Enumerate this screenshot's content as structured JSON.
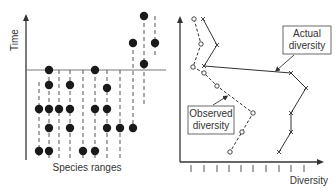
{
  "left_panel": {
    "y_axis_label": "Time",
    "x_axis_label": "Species ranges",
    "boundary_y": 70,
    "columns": [
      {
        "x": 39,
        "range": [
          82,
          158
        ],
        "dots": [
          109,
          151
        ]
      },
      {
        "x": 49,
        "range": [
          70,
          158
        ],
        "dots": [
          70,
          85,
          109,
          128,
          151
        ]
      },
      {
        "x": 59,
        "range": [
          70,
          158
        ],
        "dots": [
          109
        ]
      },
      {
        "x": 70,
        "range": [
          70,
          158
        ],
        "dots": [
          85,
          109,
          128
        ]
      },
      {
        "x": 83,
        "range": [
          70,
          158
        ],
        "dots": [
          151
        ]
      },
      {
        "x": 95,
        "range": [
          70,
          158
        ],
        "dots": [
          70,
          109,
          151
        ]
      },
      {
        "x": 107,
        "range": [
          70,
          158
        ],
        "dots": [
          88,
          109,
          128
        ]
      },
      {
        "x": 120,
        "range": [
          70,
          158
        ],
        "dots": [
          128
        ]
      },
      {
        "x": 133,
        "range": [
          43,
          128
        ],
        "dots": [
          43,
          128
        ]
      },
      {
        "x": 144,
        "range": [
          16,
          105
        ],
        "dots": [
          16,
          64
        ]
      },
      {
        "x": 155,
        "range": [
          16,
          58
        ],
        "dots": [
          43
        ]
      }
    ]
  },
  "right_panel": {
    "x_axis_label": "Diversity",
    "actual_label": [
      "Actual",
      "diversity"
    ],
    "observed_label": [
      "Observed",
      "diversity"
    ],
    "ticks_x": [
      191,
      204,
      217,
      229,
      241,
      253,
      266,
      279,
      291,
      304
    ]
  },
  "chart_data": {
    "type": "line",
    "title": "",
    "xlabel": "Diversity",
    "ylabel": "Time",
    "grid": false,
    "series": [
      {
        "name": "Observed diversity",
        "marker": "circle",
        "style": "dashed",
        "points": [
          [
            194,
            19
          ],
          [
            201,
            44
          ],
          [
            193,
            67
          ],
          [
            204,
            73
          ],
          [
            217,
            86
          ],
          [
            253,
            113
          ],
          [
            242,
            132
          ],
          [
            230,
            152
          ]
        ]
      },
      {
        "name": "Actual diversity",
        "marker": "x",
        "style": "solid",
        "points": [
          [
            203,
            19
          ],
          [
            217,
            45
          ],
          [
            204,
            66
          ],
          [
            291,
            73
          ],
          [
            306,
            88
          ],
          [
            291,
            113
          ],
          [
            291,
            132
          ],
          [
            279,
            152
          ]
        ]
      }
    ]
  }
}
